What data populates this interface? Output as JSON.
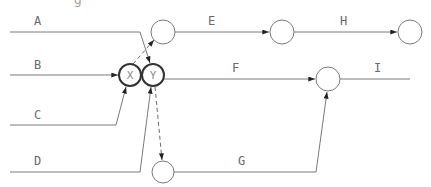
{
  "diagram": {
    "type": "activity-on-arrow network",
    "clipped_heading_fragment": "g",
    "activities": [
      {
        "label": "A",
        "from": "start",
        "to": "Y",
        "style": "solid"
      },
      {
        "label": "B",
        "from": "start",
        "to": "X",
        "style": "solid"
      },
      {
        "label": "C",
        "from": "start",
        "to": "X",
        "style": "solid"
      },
      {
        "label": "D",
        "from": "start",
        "to": "Y",
        "style": "solid"
      },
      {
        "label": "E",
        "from": "node-top-1",
        "to": "node-top-2",
        "style": "solid"
      },
      {
        "label": "F",
        "from": "Y",
        "to": "node-mid",
        "style": "solid"
      },
      {
        "label": "G",
        "from": "node-bottom",
        "to": "node-mid",
        "style": "solid"
      },
      {
        "label": "H",
        "from": "node-top-2",
        "to": "node-top-end",
        "style": "solid"
      },
      {
        "label": "I",
        "from": "node-mid",
        "to": "end",
        "style": "solid"
      }
    ],
    "dummies": [
      {
        "from": "X",
        "to": "node-top-1",
        "style": "dashed"
      },
      {
        "from": "Y",
        "to": "node-bottom",
        "style": "dashed"
      }
    ],
    "nodes": [
      {
        "id": "X",
        "label": "X",
        "bold": true
      },
      {
        "id": "Y",
        "label": "Y",
        "bold": true
      },
      {
        "id": "node-top-1",
        "label": ""
      },
      {
        "id": "node-top-2",
        "label": ""
      },
      {
        "id": "node-top-end",
        "label": ""
      },
      {
        "id": "node-mid",
        "label": ""
      },
      {
        "id": "node-bottom",
        "label": ""
      }
    ],
    "colors": {
      "line": "#7a7a7a",
      "bold_node": "#333333",
      "text": "#6a6a6a"
    }
  }
}
